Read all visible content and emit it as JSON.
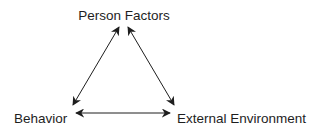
{
  "diagram": {
    "type": "triangle-reciprocal",
    "nodes": [
      {
        "id": "person",
        "label": "Person Factors"
      },
      {
        "id": "behavior",
        "label": "Behavior"
      },
      {
        "id": "environment",
        "label": "External Environment"
      }
    ],
    "edges": [
      {
        "from": "person",
        "to": "behavior",
        "direction": "bidirectional"
      },
      {
        "from": "person",
        "to": "environment",
        "direction": "bidirectional"
      },
      {
        "from": "behavior",
        "to": "environment",
        "direction": "bidirectional"
      }
    ],
    "colors": {
      "ink": "#1e1e1e",
      "background": "#ffffff"
    }
  }
}
